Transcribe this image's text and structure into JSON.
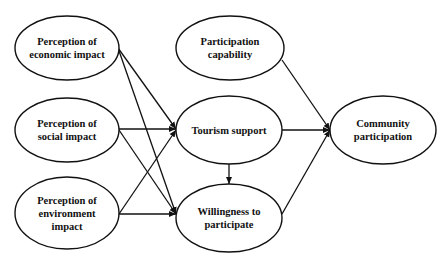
{
  "diagram": {
    "type": "path-model",
    "nodes": [
      {
        "id": "economic",
        "label": "Perception of\neconomic impact",
        "cx": 67,
        "cy": 48,
        "rx": 52,
        "ry": 32
      },
      {
        "id": "social",
        "label": "Perception of\nsocial impact",
        "cx": 67,
        "cy": 130,
        "rx": 52,
        "ry": 32
      },
      {
        "id": "environment",
        "label": "Perception of\nenvironment\nimpact",
        "cx": 67,
        "cy": 213,
        "rx": 52,
        "ry": 36
      },
      {
        "id": "capability",
        "label": "Participation\ncapability",
        "cx": 230,
        "cy": 48,
        "rx": 54,
        "ry": 32
      },
      {
        "id": "tourism",
        "label": "Tourism support",
        "cx": 229,
        "cy": 130,
        "rx": 53,
        "ry": 34
      },
      {
        "id": "willingness",
        "label": "Willingness to\nparticipate",
        "cx": 229,
        "cy": 218,
        "rx": 53,
        "ry": 34
      },
      {
        "id": "community",
        "label": "Community\nparticipation",
        "cx": 383,
        "cy": 130,
        "rx": 53,
        "ry": 34
      }
    ],
    "edges": [
      {
        "from": "economic",
        "to": "tourism",
        "x1": 118,
        "y1": 48,
        "x2": 176,
        "y2": 129
      },
      {
        "from": "economic",
        "to": "willingness",
        "x1": 118,
        "y1": 48,
        "x2": 176,
        "y2": 214
      },
      {
        "from": "social",
        "to": "tourism",
        "x1": 119,
        "y1": 129,
        "x2": 176,
        "y2": 129
      },
      {
        "from": "social",
        "to": "willingness",
        "x1": 119,
        "y1": 130,
        "x2": 176,
        "y2": 214
      },
      {
        "from": "environment",
        "to": "tourism",
        "x1": 119,
        "y1": 214,
        "x2": 176,
        "y2": 130
      },
      {
        "from": "environment",
        "to": "willingness",
        "x1": 119,
        "y1": 214,
        "x2": 176,
        "y2": 214
      },
      {
        "from": "tourism",
        "to": "willingness",
        "x1": 229,
        "y1": 164,
        "x2": 229,
        "y2": 184
      },
      {
        "from": "capability",
        "to": "community",
        "x1": 282,
        "y1": 60,
        "x2": 330,
        "y2": 130
      },
      {
        "from": "tourism",
        "to": "community",
        "x1": 282,
        "y1": 130,
        "x2": 330,
        "y2": 130
      },
      {
        "from": "willingness",
        "to": "community",
        "x1": 282,
        "y1": 214,
        "x2": 330,
        "y2": 130
      }
    ],
    "colors": {
      "stroke": "#111111",
      "background": "#ffffff",
      "text": "#111111"
    }
  }
}
